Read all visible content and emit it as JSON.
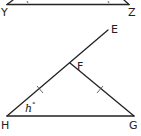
{
  "diagram": {
    "top_triangle": {
      "labels": {
        "Y": "Y",
        "Z": "Z"
      }
    },
    "bottom_triangle": {
      "labels": {
        "E": "E",
        "F": "F",
        "G": "G",
        "H": "H"
      },
      "angle_label": {
        "var": "h",
        "unit": "°"
      },
      "congruent_segments": [
        "HF",
        "FG"
      ]
    },
    "colors": {
      "stroke": "#222222",
      "background": "#ffffff"
    }
  }
}
